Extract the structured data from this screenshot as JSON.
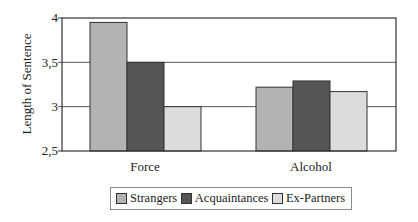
{
  "chart_data": {
    "type": "bar",
    "title": "",
    "xlabel": "",
    "ylabel": "Length of Sentence",
    "ylim": [
      2.5,
      4
    ],
    "yticks": [
      "2,5",
      "3",
      "3,5",
      "4"
    ],
    "grid": true,
    "legend_position": "bottom",
    "categories": [
      "Force",
      "Alcohol"
    ],
    "series": [
      {
        "name": "Strangers",
        "color": "#b3b3b3",
        "values": [
          3.95,
          3.22
        ]
      },
      {
        "name": "Acquaintances",
        "color": "#555555",
        "values": [
          3.5,
          3.29
        ]
      },
      {
        "name": "Ex-Partners",
        "color": "#dcdcdc",
        "values": [
          3.0,
          3.17
        ]
      }
    ]
  }
}
